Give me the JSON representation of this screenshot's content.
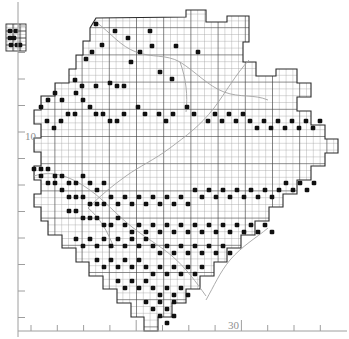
{
  "figure": {
    "kind": "distribution-map",
    "background_color": "#ffffff",
    "ink_color": "#1a1a1a",
    "grid_color": "#6b6b6b",
    "grid_minor_color": "#a8a8a8",
    "boundary_color": "#9a9a9a",
    "dot_color": "#101010",
    "axis_color": "#9e9e9e"
  },
  "axes": {
    "y_axis": {
      "name": "left-axis",
      "labels": [
        "10"
      ],
      "label_positions": [
        155
      ],
      "tick_count": 12,
      "x": 18,
      "y_top": 0,
      "y_bottom": 339
    },
    "x_axis": {
      "name": "bottom-axis",
      "labels": [
        "30"
      ],
      "label_positions": [
        235
      ],
      "tick_count": 12,
      "y": 331,
      "x_left": 18,
      "x_right": 349
    }
  },
  "chart_data": {
    "type": "scatter",
    "title": "",
    "xlabel": "",
    "ylabel": "",
    "grid": true,
    "legend": null,
    "xtick_labels": [
      "30"
    ],
    "ytick_labels": [
      "10"
    ],
    "cell_size_px": 6.8,
    "major_every": 4,
    "note": "Black squares mark occupied 10-km grid squares; faint grey lines are internal district/river boundaries.",
    "inset_island": {
      "label": "outlier-grid-block",
      "x": 6,
      "y": 24,
      "w": 20,
      "h": 27,
      "dots": [
        [
          10,
          31
        ],
        [
          16,
          31
        ],
        [
          10,
          38
        ],
        [
          14,
          38
        ],
        [
          11,
          45
        ],
        [
          17,
          45
        ],
        [
          20,
          45
        ]
      ]
    },
    "dots": [
      [
        115,
        31
      ],
      [
        128,
        38
      ],
      [
        102,
        45
      ],
      [
        150,
        31
      ],
      [
        92,
        52
      ],
      [
        86,
        59
      ],
      [
        96,
        24
      ],
      [
        131,
        62
      ],
      [
        75,
        80
      ],
      [
        82,
        86
      ],
      [
        96,
        86
      ],
      [
        110,
        83
      ],
      [
        117,
        86
      ],
      [
        124,
        86
      ],
      [
        160,
        72
      ],
      [
        172,
        79
      ],
      [
        140,
        52
      ],
      [
        152,
        46
      ],
      [
        176,
        46
      ],
      [
        198,
        52
      ],
      [
        76,
        93
      ],
      [
        83,
        100
      ],
      [
        90,
        107
      ],
      [
        62,
        100
      ],
      [
        55,
        93
      ],
      [
        48,
        100
      ],
      [
        41,
        107
      ],
      [
        68,
        114
      ],
      [
        75,
        114
      ],
      [
        61,
        121
      ],
      [
        54,
        128
      ],
      [
        47,
        121
      ],
      [
        96,
        114
      ],
      [
        103,
        114
      ],
      [
        110,
        121
      ],
      [
        117,
        121
      ],
      [
        124,
        114
      ],
      [
        138,
        107
      ],
      [
        145,
        114
      ],
      [
        159,
        114
      ],
      [
        166,
        121
      ],
      [
        173,
        114
      ],
      [
        187,
        107
      ],
      [
        194,
        114
      ],
      [
        208,
        121
      ],
      [
        215,
        114
      ],
      [
        222,
        121
      ],
      [
        229,
        114
      ],
      [
        236,
        121
      ],
      [
        243,
        114
      ],
      [
        250,
        121
      ],
      [
        257,
        128
      ],
      [
        264,
        121
      ],
      [
        271,
        128
      ],
      [
        278,
        121
      ],
      [
        285,
        128
      ],
      [
        292,
        121
      ],
      [
        299,
        128
      ],
      [
        306,
        121
      ],
      [
        313,
        128
      ],
      [
        320,
        121
      ],
      [
        34,
        169
      ],
      [
        41,
        169
      ],
      [
        48,
        169
      ],
      [
        55,
        176
      ],
      [
        41,
        176
      ],
      [
        48,
        183
      ],
      [
        55,
        183
      ],
      [
        62,
        176
      ],
      [
        69,
        183
      ],
      [
        76,
        183
      ],
      [
        83,
        176
      ],
      [
        90,
        183
      ],
      [
        97,
        190
      ],
      [
        104,
        183
      ],
      [
        62,
        190
      ],
      [
        69,
        197
      ],
      [
        76,
        197
      ],
      [
        83,
        197
      ],
      [
        90,
        204
      ],
      [
        97,
        204
      ],
      [
        104,
        204
      ],
      [
        111,
        197
      ],
      [
        118,
        204
      ],
      [
        125,
        197
      ],
      [
        132,
        204
      ],
      [
        139,
        197
      ],
      [
        146,
        204
      ],
      [
        153,
        197
      ],
      [
        160,
        204
      ],
      [
        167,
        197
      ],
      [
        174,
        204
      ],
      [
        181,
        197
      ],
      [
        188,
        204
      ],
      [
        195,
        190
      ],
      [
        202,
        197
      ],
      [
        209,
        190
      ],
      [
        216,
        197
      ],
      [
        223,
        190
      ],
      [
        230,
        197
      ],
      [
        237,
        190
      ],
      [
        244,
        197
      ],
      [
        251,
        190
      ],
      [
        258,
        197
      ],
      [
        265,
        190
      ],
      [
        272,
        197
      ],
      [
        279,
        190
      ],
      [
        286,
        183
      ],
      [
        293,
        190
      ],
      [
        300,
        183
      ],
      [
        307,
        190
      ],
      [
        314,
        183
      ],
      [
        69,
        211
      ],
      [
        76,
        211
      ],
      [
        83,
        218
      ],
      [
        90,
        218
      ],
      [
        97,
        218
      ],
      [
        104,
        225
      ],
      [
        111,
        225
      ],
      [
        118,
        218
      ],
      [
        125,
        225
      ],
      [
        132,
        232
      ],
      [
        139,
        225
      ],
      [
        146,
        232
      ],
      [
        153,
        225
      ],
      [
        160,
        232
      ],
      [
        167,
        225
      ],
      [
        174,
        232
      ],
      [
        181,
        225
      ],
      [
        188,
        232
      ],
      [
        195,
        225
      ],
      [
        202,
        232
      ],
      [
        209,
        225
      ],
      [
        216,
        232
      ],
      [
        223,
        225
      ],
      [
        230,
        232
      ],
      [
        237,
        225
      ],
      [
        244,
        232
      ],
      [
        251,
        225
      ],
      [
        258,
        232
      ],
      [
        265,
        225
      ],
      [
        272,
        232
      ],
      [
        76,
        239
      ],
      [
        83,
        246
      ],
      [
        90,
        239
      ],
      [
        97,
        246
      ],
      [
        104,
        239
      ],
      [
        111,
        246
      ],
      [
        118,
        239
      ],
      [
        125,
        246
      ],
      [
        132,
        239
      ],
      [
        139,
        246
      ],
      [
        146,
        239
      ],
      [
        153,
        246
      ],
      [
        160,
        253
      ],
      [
        167,
        246
      ],
      [
        174,
        253
      ],
      [
        181,
        246
      ],
      [
        188,
        253
      ],
      [
        195,
        246
      ],
      [
        202,
        253
      ],
      [
        209,
        246
      ],
      [
        216,
        253
      ],
      [
        223,
        246
      ],
      [
        230,
        253
      ],
      [
        97,
        260
      ],
      [
        104,
        267
      ],
      [
        111,
        260
      ],
      [
        118,
        267
      ],
      [
        125,
        260
      ],
      [
        132,
        267
      ],
      [
        139,
        260
      ],
      [
        146,
        267
      ],
      [
        153,
        274
      ],
      [
        160,
        267
      ],
      [
        167,
        274
      ],
      [
        174,
        267
      ],
      [
        181,
        274
      ],
      [
        188,
        267
      ],
      [
        195,
        274
      ],
      [
        202,
        267
      ],
      [
        118,
        281
      ],
      [
        125,
        288
      ],
      [
        132,
        281
      ],
      [
        139,
        288
      ],
      [
        146,
        281
      ],
      [
        153,
        288
      ],
      [
        160,
        295
      ],
      [
        167,
        288
      ],
      [
        174,
        295
      ],
      [
        181,
        288
      ],
      [
        188,
        295
      ],
      [
        146,
        302
      ],
      [
        153,
        309
      ],
      [
        160,
        302
      ],
      [
        167,
        309
      ],
      [
        174,
        302
      ],
      [
        160,
        316
      ],
      [
        167,
        323
      ],
      [
        174,
        316
      ]
    ]
  }
}
